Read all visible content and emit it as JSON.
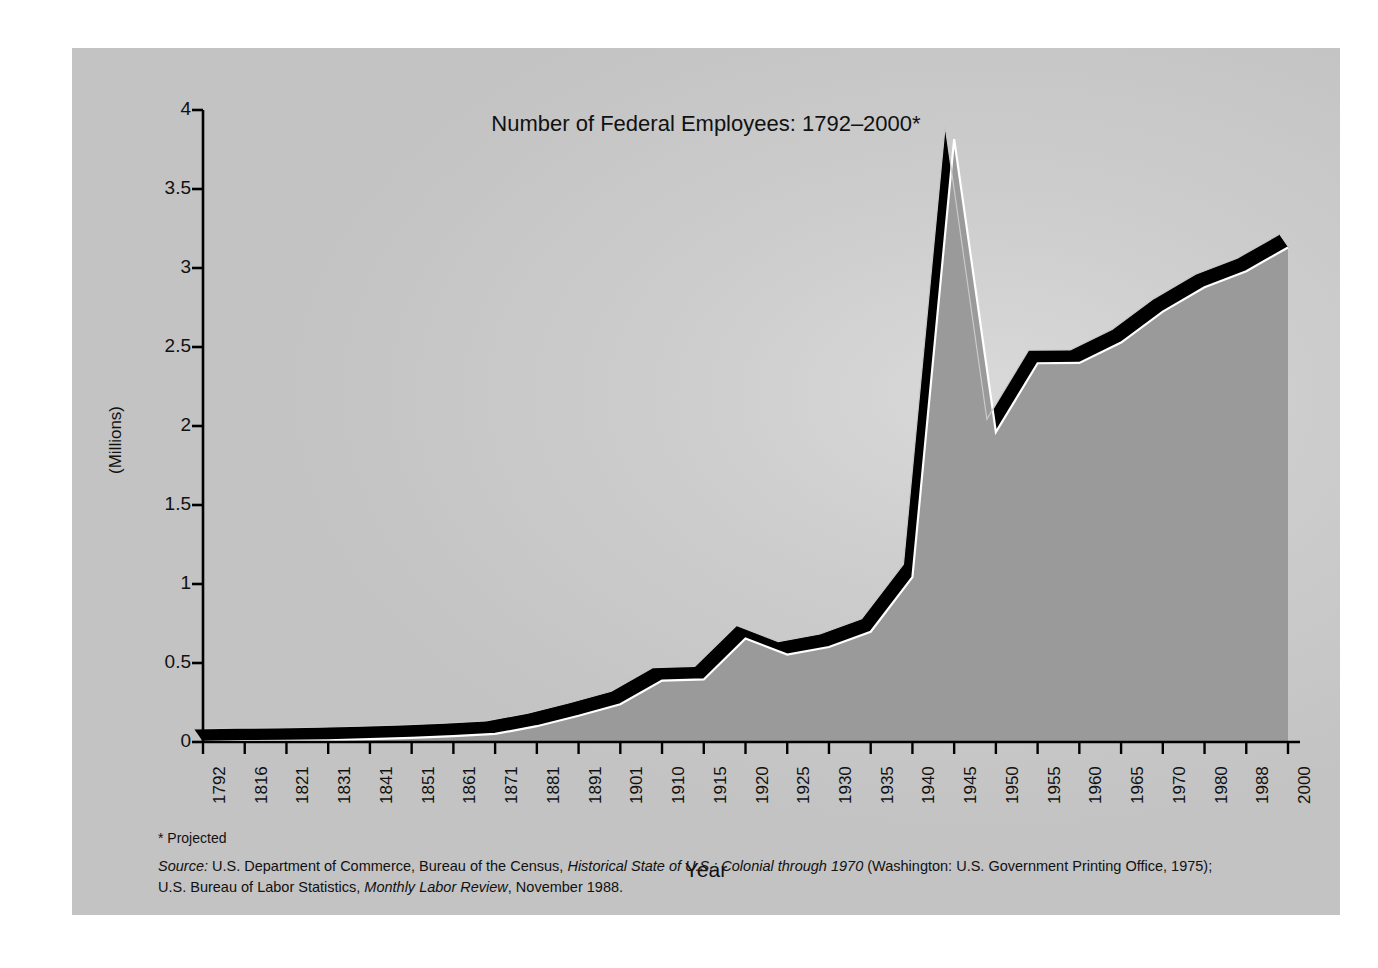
{
  "figure": {
    "title": "Number of Federal Employees: 1792–2000*",
    "projected_note": "* Projected",
    "source_prefix": "Source:",
    "source_line1_a": " U.S. Department of Commerce, Bureau of the Census, ",
    "source_line1_italic": "Historical State of U.S.: Colonial through 1970",
    "source_line1_b": " (Washington: U.S. Government Printing Office, 1975);",
    "source_line2_a": "U.S. Bureau of Labor Statistics, ",
    "source_line2_italic": "Monthly Labor Review",
    "source_line2_b": ", November 1988.",
    "panel_color": "#cdcdcd",
    "area_fill_color": "#9a9a9a",
    "area_side_color": "#000000",
    "highlight_color": "#ffffff",
    "axis_color": "#000000",
    "page_background": "#ffffff"
  },
  "chart_data": {
    "type": "area",
    "title": "Number of Federal Employees: 1792–2000*",
    "xlabel": "Year",
    "ylabel": "(Millions)",
    "ylim": [
      0,
      4
    ],
    "yticks": [
      0,
      0.5,
      1,
      1.5,
      2,
      2.5,
      3,
      3.5,
      4
    ],
    "ytick_labels": [
      "0",
      "0.5",
      "1",
      "1.5",
      "2",
      "2.5",
      "3",
      "3.5",
      "4"
    ],
    "grid": false,
    "legend": "none",
    "style": "3d-area",
    "units": "millions of employees",
    "categories": [
      "1792",
      "1816",
      "1821",
      "1831",
      "1841",
      "1851",
      "1861",
      "1871",
      "1881",
      "1891",
      "1901",
      "1910",
      "1915",
      "1920",
      "1925",
      "1930",
      "1935",
      "1940",
      "1945",
      "1950",
      "1955",
      "1960",
      "1965",
      "1970",
      "1980",
      "1988",
      "2000"
    ],
    "x": [
      1792,
      1816,
      1821,
      1831,
      1841,
      1851,
      1861,
      1871,
      1881,
      1891,
      1901,
      1910,
      1915,
      1920,
      1925,
      1930,
      1935,
      1940,
      1945,
      1950,
      1955,
      1960,
      1965,
      1970,
      1980,
      1988,
      2000
    ],
    "values": [
      0.001,
      0.005,
      0.007,
      0.011,
      0.018,
      0.026,
      0.037,
      0.051,
      0.1,
      0.166,
      0.239,
      0.389,
      0.396,
      0.655,
      0.553,
      0.601,
      0.698,
      1.043,
      3.816,
      1.961,
      2.397,
      2.399,
      2.528,
      2.724,
      2.878,
      2.98,
      3.13
    ],
    "annotations": [
      {
        "label": "World War II peak",
        "x": 1945,
        "y": 3.816
      },
      {
        "label": "Postwar trough",
        "x": 1950,
        "y": 1.961
      },
      {
        "label": "World War I bump",
        "x": 1920,
        "y": 0.655
      },
      {
        "label": "Projected",
        "x": 2000,
        "y": 3.13
      }
    ]
  }
}
